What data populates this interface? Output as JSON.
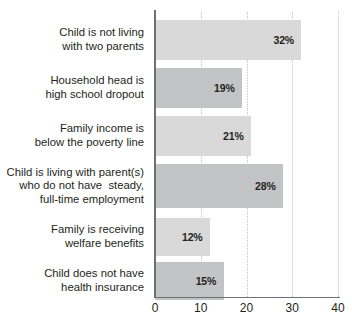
{
  "chart_data": {
    "type": "bar",
    "orientation": "horizontal",
    "title": "",
    "xlabel": "",
    "ylabel": "",
    "xlim": [
      0,
      40
    ],
    "xticks": [
      0,
      10,
      20,
      30,
      40
    ],
    "xtick_labels": [
      "0",
      "10",
      "20",
      "30",
      "40"
    ],
    "grid": true,
    "grid_axis": "x",
    "grid_style": "dotted",
    "legend": false,
    "categories": [
      "Child is not living\nwith two parents",
      "Household head is\nhigh school dropout",
      "Family income is\nbelow the poverty line",
      "Child is living with parent(s)\nwho do not have  steady,\nfull-time employment",
      "Family is receiving\nwelfare benefits",
      "Child does not have\nhealth insurance"
    ],
    "values": [
      32,
      19,
      21,
      28,
      12,
      15
    ],
    "value_labels": [
      "32%",
      "19%",
      "21%",
      "28%",
      "12%",
      "15%"
    ],
    "bar_colors": [
      "#d9d9d9",
      "#c3c4c6",
      "#d9d9d9",
      "#c3c4c6",
      "#d9d9d9",
      "#c3c4c6"
    ]
  },
  "colors": {
    "bar_light": "#d9d9d9",
    "bar_dark": "#c3c4c6",
    "axis": "#6e7072",
    "gridline": "#bfc2c5",
    "text": "#231f20",
    "background": "#ffffff"
  }
}
